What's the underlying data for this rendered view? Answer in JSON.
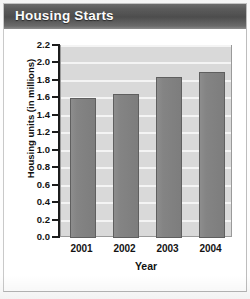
{
  "title": "Housing Starts",
  "colors": {
    "title_bar": "#4e4e4e",
    "title_text": "#ffffff",
    "plot_background": "#d9d9d9",
    "gridline": "#f4f4f4",
    "bar_fill": "#848484",
    "bar_outline": "#5f5f5f",
    "axis": "#1c1c1c",
    "page_background": "#ffffff"
  },
  "chart_data": {
    "type": "bar",
    "title": "Housing Starts",
    "categories": [
      "2001",
      "2002",
      "2003",
      "2004"
    ],
    "values": [
      1.6,
      1.65,
      1.85,
      1.9
    ],
    "xlabel": "Year",
    "ylabel": "Housing units (in millions)",
    "ylim": [
      0.0,
      2.2
    ],
    "ytick_step": 0.2,
    "ytick_labels": [
      "0.0",
      "0.2",
      "0.4",
      "0.6",
      "0.8",
      "1.0",
      "1.2",
      "1.4",
      "1.6",
      "1.8",
      "2.0",
      "2.2"
    ],
    "grid": true,
    "grid_orientation": "horizontal",
    "legend": false,
    "legend_position": "none",
    "series": [
      {
        "name": "Housing units (in millions)",
        "values": [
          1.6,
          1.65,
          1.85,
          1.9
        ]
      }
    ]
  }
}
